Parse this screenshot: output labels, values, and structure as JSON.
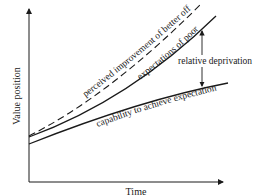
{
  "diagram": {
    "axes": {
      "x_label": "Time",
      "y_label": "Value position"
    },
    "curves": [
      {
        "id": "perceived",
        "label": "perceived improvement of better off",
        "style": "dashed"
      },
      {
        "id": "expectations",
        "label": "expectations of poor",
        "style": "solid"
      },
      {
        "id": "capability",
        "label": "capability to achieve expectation",
        "style": "solid"
      }
    ],
    "annotation": {
      "label": "relative deprivation"
    },
    "colors": {
      "line": "#1a1a1a",
      "background": "#ffffff"
    }
  }
}
